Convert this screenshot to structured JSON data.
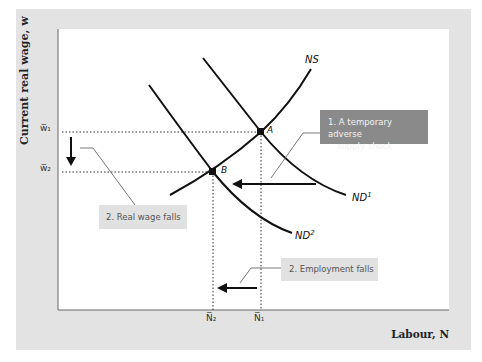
{
  "axes": {
    "y_label": "Current real wage, w",
    "x_label": "Labour, N",
    "y_ticks": [
      "w̅₁",
      "w̅₂"
    ],
    "x_ticks": [
      "N̅₂",
      "N̅₁"
    ]
  },
  "curves": {
    "ns": "NS",
    "nd1": "ND",
    "nd1_sup": "1",
    "nd2": "ND",
    "nd2_sup": "2"
  },
  "points": {
    "a": "A",
    "b": "B"
  },
  "annotations": {
    "shock_line1": "1. A temporary adverse",
    "shock_line2": "supply shock",
    "wage_falls": "2. Real wage falls",
    "employment_falls": "2. Employment falls"
  },
  "colors": {
    "panel_bg": "#e3e3e3",
    "plot_bg": "#ffffff",
    "curve": "#111111",
    "shock_box": "#8a8a8a",
    "note_box": "#e1e1e1"
  }
}
